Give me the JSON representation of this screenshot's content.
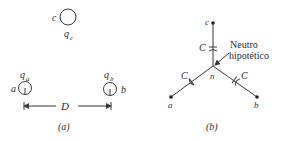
{
  "figure_a": {
    "caption": "(a)",
    "conductors": [
      {
        "id": "c",
        "label": "c",
        "charge_base": "q",
        "charge_sub": "c"
      },
      {
        "id": "a",
        "label": "a",
        "charge_base": "q",
        "charge_sub": "a"
      },
      {
        "id": "b",
        "label": "b",
        "charge_base": "q",
        "charge_sub": "b"
      }
    ],
    "spacing_label": "D"
  },
  "figure_b": {
    "caption": "(b)",
    "nodes": [
      {
        "id": "c",
        "label": "c"
      },
      {
        "id": "a",
        "label": "a"
      },
      {
        "id": "b",
        "label": "b"
      },
      {
        "id": "n",
        "label": "n"
      }
    ],
    "capacitors": [
      {
        "branch": "c-n",
        "label": "C"
      },
      {
        "branch": "a-n",
        "label": "C"
      },
      {
        "branch": "b-n",
        "label": "C"
      }
    ],
    "annotation_line1": "Neutro",
    "annotation_line2": "hipotético"
  },
  "colors": {
    "ink": "#3a3a3a",
    "background": "#ffffff"
  }
}
